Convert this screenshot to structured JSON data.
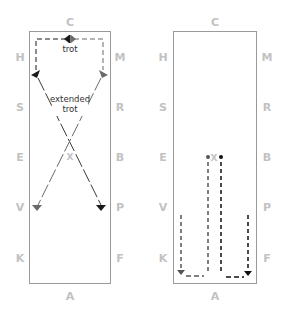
{
  "diagram": {
    "type": "dressage-arena-figures",
    "colors": {
      "border": "#9a9a9a",
      "letters": "#c2c2c2",
      "path_dark": "#1a1a1a",
      "path_gray": "#6a6a6a",
      "label": "#333333"
    },
    "arenas": [
      {
        "id": "left",
        "top_letter": "C",
        "bottom_letter": "A",
        "left_letters": [
          "H",
          "S",
          "E",
          "V",
          "K"
        ],
        "right_letters": [
          "M",
          "R",
          "B",
          "P",
          "F"
        ],
        "center_marker": "X",
        "labels": {
          "trot": "trot",
          "extended_trot_line1": "extended",
          "extended_trot_line2": "trot"
        }
      },
      {
        "id": "right",
        "top_letter": "C",
        "bottom_letter": "A",
        "left_letters": [
          "H",
          "S",
          "E",
          "V",
          "K"
        ],
        "right_letters": [
          "M",
          "R",
          "B",
          "P",
          "F"
        ],
        "center_marker": "X"
      }
    ]
  }
}
